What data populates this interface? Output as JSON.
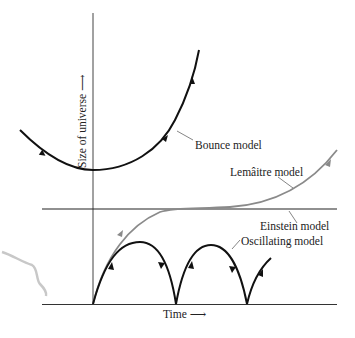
{
  "diagram": {
    "axes": {
      "y_label": "Size of universe ⟶",
      "x_label": "Time ⟶"
    },
    "models": [
      {
        "name": "bounce",
        "label": "Bounce model",
        "color": "#111111"
      },
      {
        "name": "lemaitre",
        "label": "Lemâitre model",
        "color": "#888888"
      },
      {
        "name": "einstein",
        "label": "Einstein model",
        "color": "#222222"
      },
      {
        "name": "oscillating",
        "label": "Oscillating model",
        "color": "#111111"
      }
    ]
  }
}
